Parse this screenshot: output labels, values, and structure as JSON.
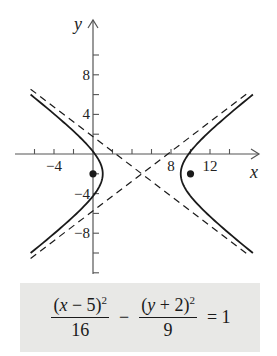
{
  "chart_data": {
    "type": "line",
    "title": "",
    "xlabel": "x",
    "ylabel": "y",
    "xlim": [
      -8,
      16
    ],
    "ylim": [
      -12,
      12
    ],
    "grid": false,
    "x_ticks": [
      -6,
      -4,
      -2,
      2,
      4,
      6,
      8,
      10,
      12,
      14
    ],
    "x_tick_labels": [
      {
        "value": -4,
        "label": "−4"
      },
      {
        "value": 8,
        "label": "8"
      },
      {
        "value": 12,
        "label": "12"
      }
    ],
    "y_ticks": [
      -12,
      -10,
      -8,
      -6,
      -4,
      -2,
      2,
      4,
      6,
      8,
      10
    ],
    "y_tick_labels": [
      {
        "value": 8,
        "label": "8"
      },
      {
        "value": 4,
        "label": "4"
      },
      {
        "value": -4,
        "label": "−4"
      },
      {
        "value": -8,
        "label": "−8"
      }
    ],
    "hyperbola": {
      "center": [
        5,
        -2
      ],
      "a": 4,
      "b": 3,
      "orientation": "horizontal",
      "x_range": [
        -6.4,
        15.8
      ],
      "style": "solid"
    },
    "asymptotes": [
      {
        "equation": "y + 2 = (3/4)(x - 5)",
        "slope": 0.75,
        "through": [
          5,
          -2
        ],
        "style": "dashed"
      },
      {
        "equation": "y + 2 = -(3/4)(x - 5)",
        "slope": -0.75,
        "through": [
          5,
          -2
        ],
        "style": "dashed"
      }
    ],
    "points": [
      {
        "label": "focus",
        "x": 0,
        "y": -2
      },
      {
        "label": "focus",
        "x": 10,
        "y": -2
      }
    ]
  },
  "equation": {
    "term1_numerator": {
      "open": "(",
      "var": "x",
      "rest": " − 5)",
      "exp": "2"
    },
    "term1_denominator": "16",
    "operator": "−",
    "term2_numerator": {
      "open": "(",
      "var": "y",
      "rest": " + 2)",
      "exp": "2"
    },
    "term2_denominator": "9",
    "rhs": "= 1"
  },
  "colors": {
    "curve": "#1a1a1a",
    "axis": "#555555",
    "box_bg": "#e8e8e6"
  }
}
